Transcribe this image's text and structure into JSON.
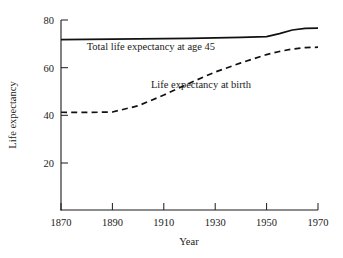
{
  "chart_data": {
    "type": "line",
    "title": "",
    "xlabel": "Year",
    "ylabel": "Life expectancy",
    "xlim": [
      1870,
      1970
    ],
    "ylim": [
      0,
      80
    ],
    "grid": false,
    "legend_position": "inline-annotations",
    "xticks": [
      1870,
      1890,
      1910,
      1930,
      1950,
      1970
    ],
    "xtick_labels": [
      "1870",
      "1890",
      "1910",
      "1930",
      "1950",
      "1970"
    ],
    "yticks": [
      20,
      40,
      60,
      80
    ],
    "ytick_labels": [
      "20",
      "40",
      "60",
      "80"
    ],
    "series": [
      {
        "name": "Total life expectancy at age 45",
        "style": "solid",
        "color": "#111111",
        "label_x": 1880,
        "label_y": 67.5,
        "x": [
          1870,
          1880,
          1890,
          1900,
          1910,
          1920,
          1930,
          1940,
          1950,
          1955,
          1960,
          1965,
          1970
        ],
        "values": [
          71.8,
          71.9,
          72.0,
          72.1,
          72.2,
          72.3,
          72.5,
          72.7,
          73.0,
          74.3,
          75.8,
          76.5,
          76.6
        ]
      },
      {
        "name": "Life expectancy at birth",
        "style": "dashed",
        "color": "#111111",
        "label_x": 1905,
        "label_y": 51.5,
        "x": [
          1870,
          1880,
          1890,
          1900,
          1910,
          1920,
          1930,
          1940,
          1950,
          1955,
          1960,
          1965,
          1970
        ],
        "values": [
          41.3,
          41.2,
          41.4,
          44.0,
          48.5,
          53.5,
          58.2,
          62.0,
          65.5,
          66.8,
          67.8,
          68.4,
          68.6
        ]
      }
    ]
  },
  "annotations": {
    "series_1_label": "Total life expectancy at age 45",
    "series_2_label": "Life expectancy at birth"
  },
  "axes": {
    "x_title": "Year",
    "y_title": "Life expectancy",
    "x_tick_1": "1870",
    "x_tick_2": "1890",
    "x_tick_3": "1910",
    "x_tick_4": "1930",
    "x_tick_5": "1950",
    "x_tick_6": "1970",
    "y_tick_1": "20",
    "y_tick_2": "40",
    "y_tick_3": "60",
    "y_tick_4": "80"
  }
}
